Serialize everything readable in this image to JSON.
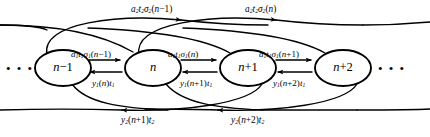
{
  "diagram": {
    "type": "state-transition-chain",
    "title": "",
    "nodes": [
      {
        "id": "n-minus-1",
        "label_main": "n",
        "label_rest": "−1",
        "cx": 63,
        "cy": 68
      },
      {
        "id": "n",
        "label_main": "n",
        "label_rest": "",
        "cx": 153,
        "cy": 68
      },
      {
        "id": "n-plus-1",
        "label_main": "n",
        "label_rest": "+1",
        "cx": 248,
        "cy": 68
      },
      {
        "id": "n-plus-2",
        "label_main": "n",
        "label_rest": "+2",
        "cx": 343,
        "cy": 68
      }
    ],
    "node_rx": 28,
    "node_ry": 18,
    "continuation": {
      "left_dots": "• • •",
      "right_dots": "• • •"
    },
    "top_arcs": [
      {
        "id": "top-arc-1",
        "label": "a2t2σ2(n−1)",
        "from": "n-minus-1",
        "to": "n-plus-1",
        "direction": "right",
        "x": 131,
        "y": 6
      },
      {
        "id": "top-arc-2",
        "label": "a2t2σ2(n)",
        "from": "n",
        "to": "n-plus-2",
        "direction": "right",
        "x": 245,
        "y": 6
      }
    ],
    "forward_labels": [
      {
        "id": "fwd-1",
        "label": "a1t1σ1(n−1)",
        "from": "n-minus-1",
        "to": "n",
        "x": 71,
        "y": 51
      },
      {
        "id": "fwd-2",
        "label": "a1t1σ1(n)",
        "from": "n",
        "to": "n-plus-1",
        "x": 168,
        "y": 51
      },
      {
        "id": "fwd-3",
        "label": "a1t1σ1(n+1)",
        "from": "n-plus-1",
        "to": "n-plus-2",
        "x": 259,
        "y": 51
      }
    ],
    "backward_labels": [
      {
        "id": "bwd-1",
        "label": "y1(n)t1",
        "from": "n",
        "to": "n-minus-1",
        "x": 90,
        "y": 80
      },
      {
        "id": "bwd-2",
        "label": "y1(n+1)t1",
        "from": "n-plus-1",
        "to": "n",
        "x": 178,
        "y": 80
      },
      {
        "id": "bwd-3",
        "label": "y1(n+2)t1",
        "from": "n-plus-2",
        "to": "n-plus-1",
        "x": 271,
        "y": 80
      }
    ],
    "bottom_arcs": [
      {
        "id": "bot-arc-1",
        "label": "y2(n+1)t2",
        "from": "n-plus-1",
        "to": "n-minus-1",
        "direction": "left",
        "x": 119,
        "y": 117
      },
      {
        "id": "bot-arc-2",
        "label": "y2(n+2)t2",
        "from": "n-plus-2",
        "to": "n",
        "direction": "left",
        "x": 229,
        "y": 117
      }
    ],
    "colors": {
      "stroke": "#000000",
      "fill": "#ffffff",
      "text": "#000000"
    }
  }
}
